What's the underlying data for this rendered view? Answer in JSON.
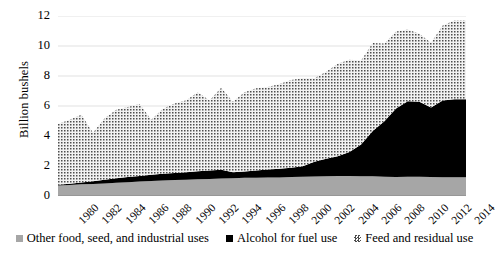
{
  "chart_data": {
    "type": "area",
    "stacked": true,
    "title": "",
    "xlabel": "",
    "ylabel": "Billion bushels",
    "ylim": [
      0,
      12
    ],
    "y_ticks": [
      0,
      2,
      4,
      6,
      8,
      10,
      12
    ],
    "grid": "horizontal",
    "legend_position": "bottom",
    "x": [
      1980,
      1981,
      1982,
      1983,
      1984,
      1985,
      1986,
      1987,
      1988,
      1989,
      1990,
      1991,
      1992,
      1993,
      1994,
      1995,
      1996,
      1997,
      1998,
      1999,
      2000,
      2001,
      2002,
      2003,
      2004,
      2005,
      2006,
      2007,
      2008,
      2009,
      2010,
      2011,
      2012,
      2013,
      2014
    ],
    "x_tick_labels": [
      "1980",
      "1982",
      "1984",
      "1986",
      "1988",
      "1990",
      "1992",
      "1994",
      "1996",
      "1998",
      "2000",
      "2002",
      "2004",
      "2006",
      "2008",
      "2010",
      "2012",
      "2014"
    ],
    "xlim": [
      1980,
      2015
    ],
    "series": [
      {
        "name": "Other food, seed, and industrial uses",
        "color": "#a6a6a6",
        "pattern": "solid",
        "values": [
          0.7,
          0.74,
          0.78,
          0.8,
          0.84,
          0.88,
          0.92,
          0.96,
          1.0,
          1.03,
          1.06,
          1.09,
          1.12,
          1.14,
          1.17,
          1.19,
          1.21,
          1.22,
          1.23,
          1.24,
          1.26,
          1.28,
          1.3,
          1.32,
          1.33,
          1.33,
          1.32,
          1.31,
          1.28,
          1.27,
          1.29,
          1.28,
          1.26,
          1.25,
          1.25
        ]
      },
      {
        "name": "Alcohol for fuel use",
        "color": "#000000",
        "pattern": "solid",
        "values": [
          0.05,
          0.08,
          0.12,
          0.18,
          0.24,
          0.3,
          0.34,
          0.38,
          0.42,
          0.45,
          0.48,
          0.5,
          0.53,
          0.56,
          0.58,
          0.4,
          0.43,
          0.48,
          0.53,
          0.57,
          0.63,
          0.71,
          0.99,
          1.17,
          1.32,
          1.6,
          2.12,
          3.03,
          3.71,
          4.57,
          5.02,
          5.0,
          4.64,
          5.12,
          5.2
        ]
      },
      {
        "name": "Feed and residual use",
        "color": "#c8c8c8",
        "pattern": "stipple",
        "values": [
          4.05,
          4.27,
          4.51,
          3.23,
          4.1,
          4.57,
          4.67,
          4.8,
          3.66,
          4.34,
          4.62,
          4.79,
          5.27,
          4.67,
          5.47,
          4.7,
          5.28,
          5.48,
          5.5,
          5.66,
          5.84,
          5.87,
          5.56,
          5.8,
          6.16,
          6.15,
          5.6,
          5.86,
          5.18,
          5.13,
          4.79,
          4.54,
          4.31,
          5.0,
          5.25
        ]
      }
    ],
    "total_values": [
      4.8,
      5.09,
      5.41,
      4.21,
      5.18,
      5.75,
      5.93,
      6.14,
      5.08,
      5.82,
      6.16,
      6.38,
      6.92,
      6.37,
      7.22,
      6.29,
      6.92,
      7.18,
      7.26,
      7.47,
      7.73,
      7.86,
      7.85,
      8.29,
      8.81,
      9.08,
      9.04,
      10.2,
      10.17,
      10.97,
      11.1,
      10.82,
      10.21,
      11.37,
      11.7
    ]
  },
  "y_axis": {
    "title": "Billion bushels",
    "ticks": [
      "0",
      "2",
      "4",
      "6",
      "8",
      "10",
      "12"
    ]
  },
  "x_axis": {
    "ticks": [
      "1980",
      "1982",
      "1984",
      "1986",
      "1988",
      "1990",
      "1992",
      "1994",
      "1996",
      "1998",
      "2000",
      "2002",
      "2004",
      "2006",
      "2008",
      "2010",
      "2012",
      "2014"
    ]
  },
  "legend": {
    "entries": [
      {
        "label": "Other food, seed, and industrial uses",
        "swatch": "gray-square-icon",
        "color": "#a6a6a6"
      },
      {
        "label": "Alcohol for fuel use",
        "swatch": "black-square-icon",
        "color": "#000000"
      },
      {
        "label": "Feed and residual use",
        "swatch": "stipple-square-icon",
        "color": "#c8c8c8"
      }
    ]
  }
}
